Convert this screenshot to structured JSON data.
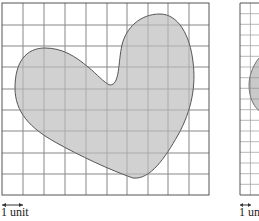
{
  "figures": [
    {
      "name": "coarse-grid",
      "grid": {
        "x": 2,
        "y": 3,
        "cols": 10,
        "rows": 9,
        "cell_w": 20.7,
        "cell_h": 21.3
      },
      "shape": "heart",
      "unit_label": "1 unit"
    },
    {
      "name": "fine-grid",
      "grid": {
        "x": 240,
        "y": 3,
        "cols": 20,
        "rows": 18,
        "cell_w": 10.4,
        "cell_h": 10.67
      },
      "shape": "heart",
      "unit_label": "1 unit"
    }
  ],
  "colors": {
    "grid_line": "#8a8a8a",
    "border": "#555555",
    "shape_fill": "#c9c9c9",
    "shape_stroke": "#555555"
  }
}
